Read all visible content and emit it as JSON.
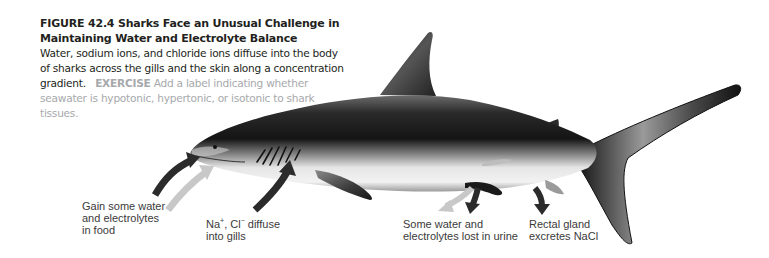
{
  "figure": {
    "title_line1": "FIGURE 42.4  Sharks Face an Unusual Challenge in",
    "title_line2": "Maintaining Water and Electrolyte Balance",
    "body": "Water, sodium ions, and chloride ions diffuse into the body of sharks across the gills and the skin along a concentration gradient.",
    "exercise_label": "EXERCISE",
    "exercise_text": "Add a label indicating whether seawater is hypotonic, hypertonic, or isotonic to shark tissues."
  },
  "labels": {
    "food": "Gain some water\nand electrolytes\nin food",
    "gills_na": "Na",
    "gills_na_sup": "+",
    "gills_cl": ", Cl",
    "gills_cl_sup": "−",
    "gills_rest": " diffuse",
    "gills_line2": "into gills",
    "urine": "Some water and\nelectrolytes lost in urine",
    "rectal": "Rectal gland\nexcretes NaCl"
  },
  "colors": {
    "caption_text": "#231f20",
    "exercise": "#a7a9ac",
    "arrow_dark": "#2b2b2b",
    "arrow_light": "#c8c8c8",
    "label_text": "#3a3a3a"
  }
}
